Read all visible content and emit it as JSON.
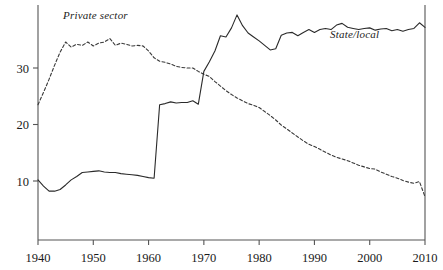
{
  "chart_data": {
    "type": "line",
    "title": "",
    "subtitle": "",
    "xlabel": "",
    "ylabel": "",
    "xlim": [
      1940,
      2010
    ],
    "ylim": [
      0,
      40
    ],
    "grid": false,
    "legend_position": "inline-annotations",
    "x_ticks": [
      1940,
      1950,
      1960,
      1970,
      1980,
      1990,
      2000,
      2010
    ],
    "x_tick_labels": [
      "1940",
      "1950",
      "1960",
      "1970",
      "1980",
      "1990",
      "2000",
      "2010"
    ],
    "y_ticks": [
      10,
      20,
      30
    ],
    "y_tick_labels": [
      "10",
      "20",
      "30"
    ],
    "annotations": [
      {
        "text": "Private sector",
        "x": 1948,
        "y": 39.5
      },
      {
        "text": "State/local",
        "x": 1993,
        "y": 36.0
      }
    ],
    "series": [
      {
        "name": "Private sector",
        "style": "dashed",
        "color": "#3a3a3a",
        "x": [
          1940,
          1941,
          1942,
          1943,
          1944,
          1945,
          1946,
          1947,
          1948,
          1949,
          1950,
          1951,
          1952,
          1953,
          1954,
          1955,
          1956,
          1957,
          1958,
          1959,
          1960,
          1961,
          1962,
          1963,
          1964,
          1965,
          1966,
          1967,
          1968,
          1969,
          1970,
          1971,
          1972,
          1973,
          1974,
          1975,
          1976,
          1977,
          1978,
          1979,
          1980,
          1981,
          1982,
          1983,
          1984,
          1985,
          1986,
          1987,
          1988,
          1989,
          1990,
          1991,
          1992,
          1993,
          1994,
          1995,
          1996,
          1997,
          1998,
          1999,
          2000,
          2001,
          2002,
          2003,
          2004,
          2005,
          2006,
          2007,
          2008,
          2009,
          2010
        ],
        "values": [
          23.5,
          25.7,
          28.0,
          30.5,
          32.8,
          34.6,
          33.7,
          34.2,
          34.0,
          34.6,
          33.9,
          34.4,
          34.6,
          35.2,
          34.0,
          34.4,
          34.2,
          33.9,
          34.0,
          33.9,
          33.0,
          31.8,
          31.2,
          31.0,
          30.7,
          30.3,
          30.1,
          30.0,
          30.0,
          29.4,
          28.9,
          28.5,
          27.6,
          26.8,
          26.0,
          25.3,
          24.7,
          24.2,
          23.7,
          23.4,
          23.0,
          22.3,
          21.6,
          20.8,
          19.9,
          19.2,
          18.5,
          17.8,
          17.1,
          16.5,
          16.1,
          15.6,
          15.1,
          14.6,
          14.2,
          13.9,
          13.6,
          13.2,
          12.8,
          12.5,
          12.2,
          12.1,
          11.6,
          11.2,
          10.8,
          10.5,
          10.1,
          9.8,
          9.6,
          9.9,
          7.2
        ]
      },
      {
        "name": "State/local",
        "style": "solid",
        "color": "#2a2a2a",
        "x": [
          1940,
          1941,
          1942,
          1943,
          1944,
          1945,
          1946,
          1947,
          1948,
          1949,
          1950,
          1951,
          1952,
          1953,
          1954,
          1955,
          1956,
          1957,
          1958,
          1959,
          1960,
          1961,
          1962,
          1963,
          1964,
          1965,
          1966,
          1967,
          1968,
          1969,
          1970,
          1971,
          1972,
          1973,
          1974,
          1975,
          1976,
          1977,
          1978,
          1979,
          1980,
          1981,
          1982,
          1983,
          1984,
          1985,
          1986,
          1987,
          1988,
          1989,
          1990,
          1991,
          1992,
          1993,
          1994,
          1995,
          1996,
          1997,
          1998,
          1999,
          2000,
          2001,
          2002,
          2003,
          2004,
          2005,
          2006,
          2007,
          2008,
          2009,
          2010
        ],
        "values": [
          10.2,
          9.1,
          8.2,
          8.2,
          8.5,
          9.3,
          10.2,
          10.8,
          11.5,
          11.6,
          11.7,
          11.8,
          11.6,
          11.5,
          11.5,
          11.3,
          11.2,
          11.1,
          11.0,
          10.8,
          10.6,
          10.5,
          23.5,
          23.7,
          24.0,
          23.8,
          23.9,
          23.9,
          24.2,
          23.6,
          29.4,
          31.1,
          33.0,
          35.7,
          35.5,
          37.1,
          39.4,
          37.5,
          36.2,
          35.5,
          34.8,
          34.0,
          33.2,
          33.4,
          35.8,
          36.2,
          36.3,
          35.7,
          36.3,
          36.8,
          36.3,
          36.8,
          37.0,
          36.8,
          37.6,
          37.9,
          37.2,
          37.0,
          36.8,
          37.0,
          37.1,
          36.7,
          36.9,
          37.0,
          36.6,
          36.8,
          36.5,
          36.8,
          37.0,
          38.0,
          37.2
        ]
      }
    ]
  },
  "axes": {
    "left_axis_name": "y-axis",
    "bottom_axis_name": "x-axis"
  }
}
